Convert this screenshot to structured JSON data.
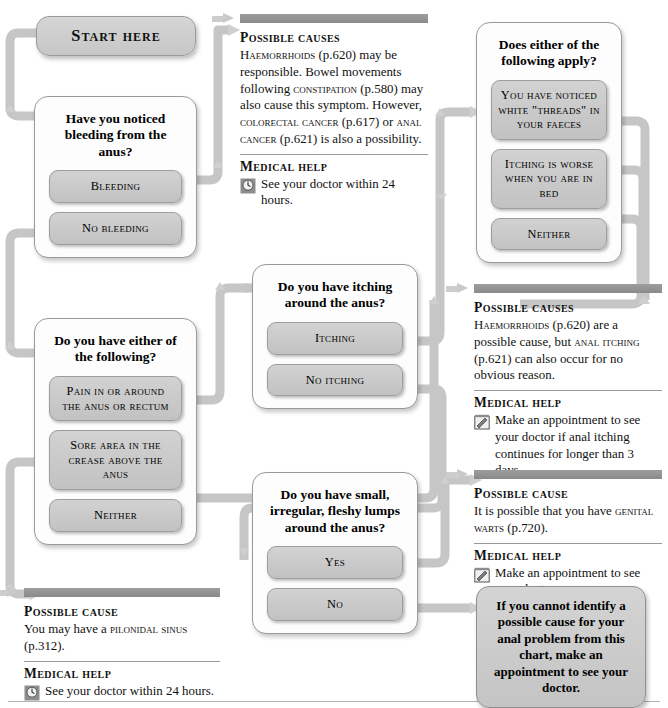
{
  "chart": {
    "start_label": "Start here"
  },
  "questions": [
    {
      "id": "bleeding",
      "title": "Have you noticed bleeding from the anus?",
      "options": [
        "Bleeding",
        "No bleeding"
      ]
    },
    {
      "id": "pain",
      "title": "Do you have either of the following?",
      "options": [
        "Pain in or around the anus or rectum",
        "Sore area in the crease above the anus",
        "Neither"
      ]
    },
    {
      "id": "itching",
      "title": "Do you have itching around the anus?",
      "options": [
        "Itching",
        "No itching"
      ]
    },
    {
      "id": "lumps",
      "title": "Do you have small, irregular, fleshy lumps around the anus?",
      "options": [
        "Yes",
        "No"
      ]
    },
    {
      "id": "threads",
      "title": "Does either of the following apply?",
      "options": [
        "You have noticed white \"threads\" in your faeces",
        "Itching is worse when you are in bed",
        "Neither"
      ]
    }
  ],
  "panels": [
    {
      "id": "bleeding-causes",
      "heading": "Possible causes",
      "body_html": "<span class=\"sc\">Haemorrhoids</span> (p.620) may be responsible. Bowel movements following <span class=\"sc\">constipation</span> (p.580) may also cause this symptom. However, <span class=\"sc\">colorectal cancer</span> (p.617) or <span class=\"sc\">anal cancer</span> (p.621) is also a possibility.",
      "help_heading": "Medical help",
      "help_text": "See your doctor within 24 hours.",
      "help_icon": "clock-icon"
    },
    {
      "id": "itching-causes",
      "heading": "Possible causes",
      "body_html": "<span class=\"sc\">Haemorrhoids</span> (p.620) are a possible cause, but <span class=\"sc\">anal itching</span> (p.621) can also occur for no obvious reason.",
      "help_heading": "Medical help",
      "help_text": "Make an appointment to see your doctor if anal itching continues for longer than 3 days.",
      "help_icon": "appointment-icon"
    },
    {
      "id": "warts-cause",
      "heading": "Possible cause",
      "body_html": "It is possible that you have <span class=\"sc\">genital warts</span> (p.720).",
      "help_heading": "Medical help",
      "help_text": "Make an appointment to see your doctor.",
      "help_icon": "appointment-icon"
    },
    {
      "id": "pilonidal-cause",
      "heading": "Possible cause",
      "body_html": "You may have a <span class=\"sc\">pilonidal sinus</span> (p.312).",
      "help_heading": "Medical help",
      "help_text": "See your doctor within 24 hours.",
      "help_icon": "clock-icon"
    }
  ],
  "advice": {
    "text": "If you cannot identify a possible cause for your anal problem from this chart, make an appointment to see your doctor."
  },
  "colors": {
    "connector": "#c9c9c9",
    "connector_edge": "#b0b0b0",
    "option_fill": "#cacaca",
    "panel_bar": "#8f8f8f",
    "box_border": "#9a9a9a"
  }
}
